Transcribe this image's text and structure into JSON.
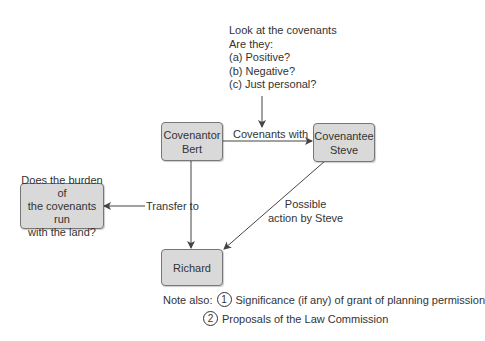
{
  "question_note": {
    "lines": [
      "Look at the covenants",
      "Are they:",
      "(a) Positive?",
      "(b) Negative?",
      "(c) Just personal?"
    ]
  },
  "nodes": {
    "covenantor": {
      "line1": "Covenantor",
      "line2": "Bert"
    },
    "covenantee": {
      "line1": "Covenantee",
      "line2": "Steve"
    },
    "richard": {
      "label": "Richard"
    },
    "burden": {
      "line1": "Does the burden of",
      "line2": "the covenants run",
      "line3": "with the land?"
    }
  },
  "edges": {
    "covenants_with": "Covenants with",
    "transfer_to": "Transfer to",
    "possible_action_line1": "Possible",
    "possible_action_line2": "action by Steve"
  },
  "notes": {
    "label": "Note also:",
    "items": [
      {
        "num": "1",
        "text": "Significance (if any) of grant of planning permission"
      },
      {
        "num": "2",
        "text": "Proposals of the Law Commission"
      }
    ]
  },
  "colors": {
    "box_fill": "#d9d9d9",
    "box_border": "#777777",
    "line": "#444444"
  }
}
